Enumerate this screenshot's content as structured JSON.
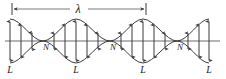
{
  "figure": {
    "kind": "standing-wave-diagram",
    "width": 226,
    "height": 79,
    "background_color": "#ffffff",
    "stroke_color": "#3a3a3a",
    "text_color": "#1a1a1a",
    "axis_color": "#6b6b6b"
  },
  "wavelength_marker": {
    "label": "λ",
    "label_x": 78,
    "label_y": 12,
    "line_y": 9,
    "start_x": 12,
    "end_x": 146,
    "tick_half_height": 6,
    "arrowhead": "double-inward"
  },
  "axis": {
    "y": 41,
    "start_x": 5,
    "end_x": 220
  },
  "envelope": {
    "amplitude": 22,
    "half_loop_width": 66.5,
    "start_x": 10,
    "end_x": 209,
    "node_positions": [
      43,
      110,
      177
    ],
    "antinode_positions": [
      10,
      76,
      143,
      209
    ]
  },
  "node_labels": [
    {
      "text": "N",
      "x": 46,
      "y": 50
    },
    {
      "text": "N",
      "x": 113,
      "y": 50
    },
    {
      "text": "N",
      "x": 180,
      "y": 50
    }
  ],
  "loop_labels": [
    {
      "text": "L",
      "x": 10,
      "y": 72
    },
    {
      "text": "L",
      "x": 76,
      "y": 72
    },
    {
      "text": "L",
      "x": 143,
      "y": 72
    },
    {
      "text": "L",
      "x": 209,
      "y": 72
    }
  ],
  "displacement_arrows": {
    "description": "double-headed vertical arrows whose half-length equals the envelope amplitude at that x",
    "x_positions": [
      10,
      21,
      32,
      54,
      65,
      76,
      87,
      98,
      121,
      132,
      143,
      154,
      165,
      188,
      199,
      209
    ]
  }
}
